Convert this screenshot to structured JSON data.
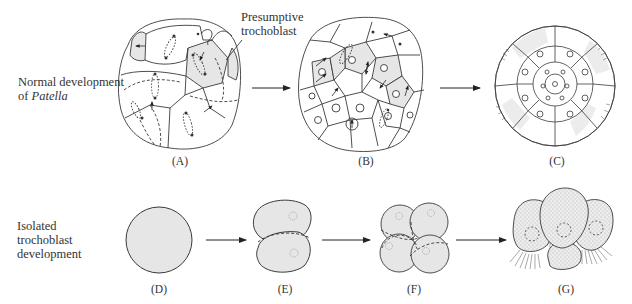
{
  "figure": {
    "rows": [
      {
        "id": "normal",
        "label_line1": "Normal development",
        "label_line2_prefix": "of ",
        "label_line2_italic": "Patella",
        "panels": [
          {
            "id": "A",
            "label": "(A)",
            "description": "Early cleavage embryo with presumptive trochoblast cells shaded, mitotic spindles and arrows"
          },
          {
            "id": "B",
            "label": "(B)",
            "description": "Later embryo with more cells, shaded trochoblast band, arrows showing division"
          },
          {
            "id": "C",
            "label": "(C)",
            "description": "Embryo with ciliated trochoblast ring around many small central cells"
          }
        ]
      },
      {
        "id": "isolated",
        "label_line1": "Isolated",
        "label_line2": "trochoblast",
        "label_line3": "development",
        "panels": [
          {
            "id": "D",
            "label": "(D)",
            "description": "Single isolated shaded trochoblast cell"
          },
          {
            "id": "E",
            "label": "(E)",
            "description": "Two-cell stage"
          },
          {
            "id": "F",
            "label": "(F)",
            "description": "Four-cell stage"
          },
          {
            "id": "G",
            "label": "(G)",
            "description": "Ciliated cells with cilia fringes"
          }
        ]
      }
    ],
    "callout": {
      "line1": "Presumptive",
      "line2": "trochoblast",
      "points_to": "A"
    },
    "arrows": [
      {
        "from": "A",
        "to": "B"
      },
      {
        "from": "B",
        "to": "C"
      },
      {
        "from": "D",
        "to": "E"
      },
      {
        "from": "E",
        "to": "F"
      },
      {
        "from": "F",
        "to": "G"
      }
    ],
    "colors": {
      "line": "#3a3a3a",
      "shade": "#e6e6e6",
      "background": "#ffffff"
    }
  }
}
